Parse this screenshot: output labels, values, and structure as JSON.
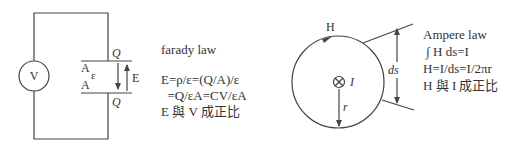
{
  "left_diagram": {
    "source_label": "V",
    "plate_top_charge": "Q",
    "plate_bottom_charge": "Q",
    "plate_top_area": "A",
    "plate_bottom_area": "A",
    "permittivity": "ε",
    "field_label": "E"
  },
  "faraday": {
    "title": "farady law",
    "line1": "E=ρ/ε=(Q/A)/ε",
    "line2": "  =Q/εA=CV/εA",
    "line3": "E 與 V 成正比"
  },
  "right_diagram": {
    "field_label": "H",
    "current_label": "I",
    "radius_label": "r",
    "segment_label": "ds"
  },
  "ampere": {
    "title": "Ampere law",
    "line1": " ∫ H ds=I",
    "line2": "H=I/ds=I/2πr",
    "line3": "H 與 I 成正比"
  },
  "colors": {
    "stroke": "#444444",
    "text": "#333333",
    "background": "#ffffff"
  }
}
